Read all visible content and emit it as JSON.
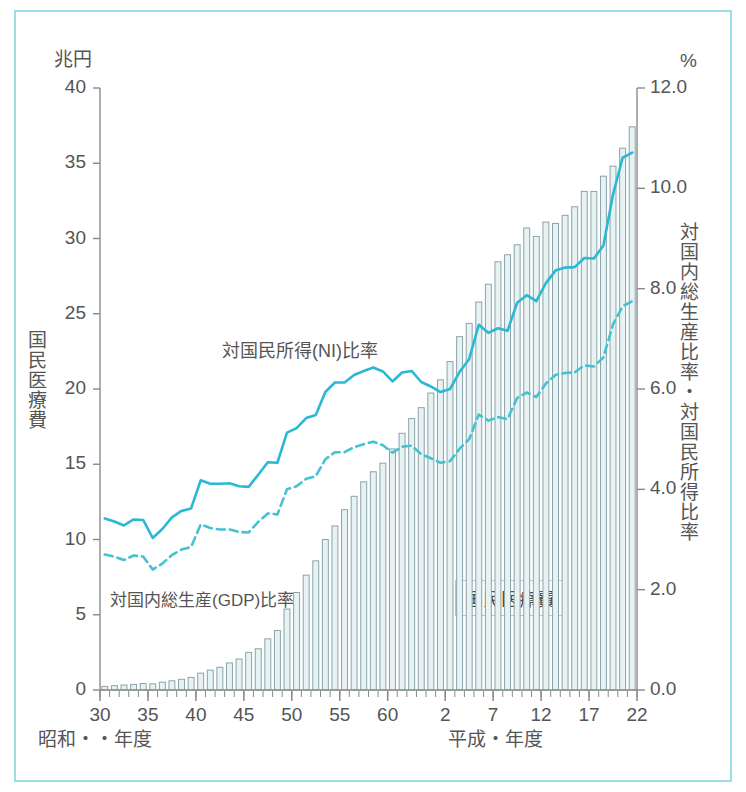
{
  "axes": {
    "left_unit": "兆円",
    "right_unit": "%",
    "left_title": "国民医療費",
    "right_title": "対国内総生産比率・対国民所得比率",
    "left_ticks": [
      "40",
      "35",
      "30",
      "25",
      "20",
      "15",
      "10",
      "5",
      "0"
    ],
    "right_ticks": [
      "12.0",
      "10.0",
      "8.0",
      "6.0",
      "4.0",
      "2.0",
      "0.0"
    ],
    "x_ticks": [
      "30",
      "35",
      "40",
      "45",
      "50",
      "55",
      "60",
      "2",
      "7",
      "12",
      "17",
      "22"
    ],
    "era_left": "昭和・・年度",
    "era_right": "平成・年度"
  },
  "annotations": {
    "ni_line": "対国民所得(NI)比率",
    "gdp_line": "対国内総生産(GDP)比率",
    "bars": "国民医療費"
  },
  "colors": {
    "frame": "#9ddfe6",
    "line_ni": "#2bb8d4",
    "line_gdp": "#45c2d2",
    "bar_fill": "#e7f2f2",
    "bar_stroke": "#8aa3ab",
    "axis": "#8a8a8a",
    "text": "#555555"
  },
  "chart_data": {
    "type": "bar",
    "xlabel": "年度（昭和30年度〜平成22年度）",
    "ylabel": "国民医療費（兆円）",
    "y2label": "対国内総生産比率・対国民所得比率（%）",
    "ylim": [
      0,
      40
    ],
    "y2lim": [
      0,
      12
    ],
    "grid": false,
    "legend": "inline-annotations",
    "categories": [
      "昭和30",
      "昭和31",
      "昭和32",
      "昭和33",
      "昭和34",
      "昭和35",
      "昭和36",
      "昭和37",
      "昭和38",
      "昭和39",
      "昭和40",
      "昭和41",
      "昭和42",
      "昭和43",
      "昭和44",
      "昭和45",
      "昭和46",
      "昭和47",
      "昭和48",
      "昭和49",
      "昭和50",
      "昭和51",
      "昭和52",
      "昭和53",
      "昭和54",
      "昭和55",
      "昭和56",
      "昭和57",
      "昭和58",
      "昭和59",
      "昭和60",
      "昭和61",
      "昭和62",
      "昭和63",
      "平成元",
      "平成2",
      "平成3",
      "平成4",
      "平成5",
      "平成6",
      "平成7",
      "平成8",
      "平成9",
      "平成10",
      "平成11",
      "平成12",
      "平成13",
      "平成14",
      "平成15",
      "平成16",
      "平成17",
      "平成18",
      "平成19",
      "平成20",
      "平成21",
      "平成22"
    ],
    "x_tick_labels": [
      "30",
      "35",
      "40",
      "45",
      "50",
      "55",
      "60",
      "2",
      "7",
      "12",
      "17",
      "22"
    ],
    "series": [
      {
        "name": "国民医療費",
        "unit": "兆円",
        "axis": "left",
        "type": "bar",
        "values": [
          0.24,
          0.29,
          0.33,
          0.37,
          0.43,
          0.41,
          0.52,
          0.61,
          0.71,
          0.84,
          1.12,
          1.32,
          1.51,
          1.8,
          2.06,
          2.5,
          2.74,
          3.4,
          3.95,
          5.38,
          6.48,
          7.63,
          8.58,
          10.0,
          10.9,
          11.98,
          12.87,
          13.83,
          14.5,
          15.07,
          16.02,
          17.06,
          18.04,
          18.76,
          19.73,
          20.61,
          21.82,
          23.48,
          24.36,
          25.78,
          26.96,
          28.45,
          28.92,
          29.58,
          30.7,
          30.14,
          31.09,
          31.0,
          31.54,
          32.11,
          33.13,
          33.13,
          34.14,
          34.81,
          36.0,
          37.42
        ]
      },
      {
        "name": "対国民所得(NI)比率",
        "unit": "%",
        "axis": "right",
        "type": "line",
        "style": "solid",
        "values": [
          3.42,
          3.36,
          3.28,
          3.4,
          3.39,
          3.03,
          3.21,
          3.44,
          3.57,
          3.62,
          4.18,
          4.11,
          4.11,
          4.12,
          4.06,
          4.05,
          4.29,
          4.54,
          4.53,
          5.13,
          5.22,
          5.42,
          5.48,
          5.94,
          6.13,
          6.13,
          6.28,
          6.36,
          6.43,
          6.35,
          6.15,
          6.33,
          6.36,
          6.14,
          6.05,
          5.94,
          6.0,
          6.34,
          6.6,
          7.28,
          7.12,
          7.21,
          7.16,
          7.72,
          7.87,
          7.75,
          8.11,
          8.36,
          8.42,
          8.43,
          8.61,
          8.6,
          8.86,
          9.88,
          10.61,
          10.71
        ]
      },
      {
        "name": "対国内総生産(GDP)比率",
        "unit": "%",
        "axis": "right",
        "type": "line",
        "style": "dashed",
        "values": [
          2.7,
          2.66,
          2.59,
          2.68,
          2.66,
          2.4,
          2.52,
          2.69,
          2.8,
          2.85,
          3.3,
          3.23,
          3.2,
          3.2,
          3.15,
          3.14,
          3.35,
          3.52,
          3.5,
          4.0,
          4.06,
          4.21,
          4.26,
          4.6,
          4.74,
          4.74,
          4.84,
          4.9,
          4.95,
          4.88,
          4.73,
          4.85,
          4.87,
          4.7,
          4.62,
          4.53,
          4.56,
          4.81,
          5.0,
          5.49,
          5.37,
          5.44,
          5.4,
          5.82,
          5.93,
          5.84,
          6.11,
          6.28,
          6.32,
          6.33,
          6.47,
          6.45,
          6.63,
          7.29,
          7.65,
          7.75
        ]
      }
    ]
  },
  "geometry": {
    "plot_left": 100,
    "plot_right": 637,
    "plot_top": 88,
    "plot_bottom": 690
  }
}
